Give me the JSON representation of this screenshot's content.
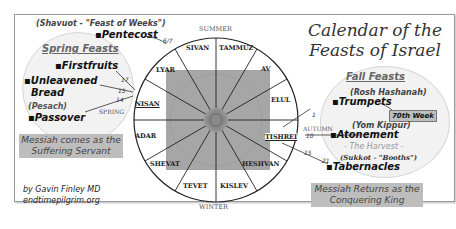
{
  "title": {
    "line1": "Calendar of the",
    "line2": "Feasts of Israel"
  },
  "seasons": {
    "top": "SUMMER",
    "bottom": "WINTER",
    "left": "SPRING",
    "right": "AUTUMN"
  },
  "months": [
    "SIVAN",
    "TAMMUZ",
    "AV",
    "ELUL",
    "TISHREI",
    "HESHVAN",
    "KISLEV",
    "TEVET",
    "SHEVAT",
    "ADAR",
    "NISAN",
    "LYAR"
  ],
  "spring": {
    "header": "Spring Feasts",
    "pentecost_hebrew": "(Shavuot - \"Feast of Weeks\")",
    "pentecost": "Pentecost",
    "pentecost_day": "6/7",
    "firstfruits": "Firstfruits",
    "firstfruits_day": "17",
    "unleavened_line1": "Unleavened",
    "unleavened_line2": "Bread",
    "unleavened_day": "15",
    "passover_hebrew": "(Pesach)",
    "passover": "Passover",
    "passover_day": "14",
    "message_line1": "Messiah comes as the",
    "message_line2": "Suffering Servant"
  },
  "fall": {
    "header": "Fall Feasts",
    "trumpets_hebrew": "(Rosh Hashanah)",
    "trumpets": "Trumpets",
    "trumpets_day": "1",
    "badge": "70th Week",
    "atonement_hebrew": "(Yom Kippur)",
    "atonement": "Atonement",
    "atonement_day": "10",
    "harvest": "- The Harvest -",
    "tabernacles_hebrew": "(Sukkot - \"Booths\")",
    "tabernacles": "Tabernacles",
    "tabernacles_day1": "15",
    "tabernacles_day2": "21",
    "message_line1": "Messiah Returns as the",
    "message_line2": "Conquering King"
  },
  "credit": {
    "author": "by Gavin Finley MD",
    "site": "endtimepilgrim.org"
  },
  "colors": {
    "bubble": "#f2f2f2",
    "message_bg": "#bdbdbd",
    "wheel_center": "#a8a8a8"
  }
}
